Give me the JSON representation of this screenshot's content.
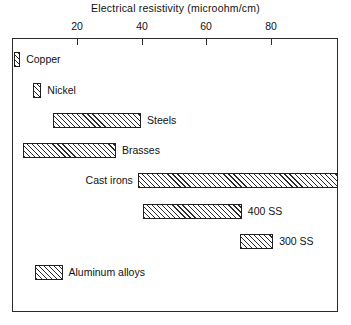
{
  "chart_data": {
    "type": "bar",
    "orientation": "horizontal",
    "title": "Electrical resistivity (microohm/cm)",
    "xlabel": "Electrical resistivity (microohm/cm)",
    "ylabel": "",
    "xlim": [
      0,
      100
    ],
    "xticks": [
      20,
      40,
      60,
      80
    ],
    "xticklabels": [
      "20",
      "40",
      "60",
      "80"
    ],
    "grid": false,
    "legend": false,
    "note": "Floating horizontal range bars; each bar spans a min-max resistivity range.",
    "categories": [
      "Copper",
      "Nickel",
      "Steels",
      "Brasses",
      "Cast irons",
      "400 SS",
      "300 SS",
      "Aluminum alloys"
    ],
    "ranges": [
      {
        "label": "Copper",
        "start": 0.6,
        "end": 2.5,
        "label_side": "right"
      },
      {
        "label": "Nickel",
        "start": 6.5,
        "end": 9.0,
        "label_side": "right"
      },
      {
        "label": "Steels",
        "start": 12.7,
        "end": 39.6,
        "label_side": "right"
      },
      {
        "label": "Brasses",
        "start": 3.4,
        "end": 31.9,
        "label_side": "right"
      },
      {
        "label": "Cast irons",
        "start": 38.6,
        "end": 100.0,
        "label_side": "left"
      },
      {
        "label": "400 SS",
        "start": 40.2,
        "end": 70.5,
        "label_side": "right"
      },
      {
        "label": "300 SS",
        "start": 69.9,
        "end": 80.1,
        "label_side": "right"
      },
      {
        "label": "Aluminum alloys",
        "start": 7.1,
        "end": 15.5,
        "label_side": "right"
      }
    ],
    "values": [
      2.5,
      9.0,
      39.6,
      31.9,
      100.0,
      70.5,
      80.1,
      15.5
    ]
  },
  "style": {
    "frame_color": "#2b2b2b",
    "bar_edge_color": "#1f1f1f",
    "bar_fill": "#ffffff",
    "hatch": "forward-diagonal",
    "text_color": "#111111",
    "background": "#ffffff"
  }
}
